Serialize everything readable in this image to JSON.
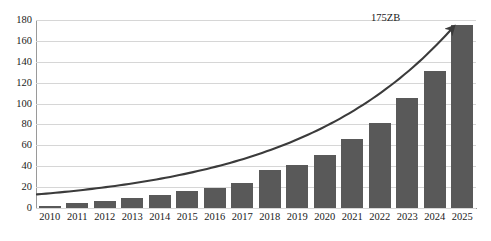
{
  "chart_data": {
    "type": "bar",
    "title": "",
    "subtitle": "",
    "xlabel": "",
    "ylabel": "",
    "categories": [
      "2010",
      "2011",
      "2012",
      "2013",
      "2014",
      "2015",
      "2016",
      "2017",
      "2018",
      "2019",
      "2020",
      "2021",
      "2022",
      "2023",
      "2024",
      "2025"
    ],
    "values": [
      2,
      5,
      7,
      10,
      12,
      16,
      19,
      24,
      36,
      41,
      51,
      66,
      81,
      105,
      131,
      175
    ],
    "series": [
      {
        "name": "Global data volume",
        "values": [
          2,
          5,
          7,
          10,
          12,
          16,
          19,
          24,
          36,
          41,
          51,
          66,
          81,
          105,
          131,
          175
        ]
      }
    ],
    "ylim": [
      0,
      180
    ],
    "ytick_labels": [
      "0",
      "20",
      "40",
      "60",
      "80",
      "100",
      "120",
      "140",
      "160",
      "180"
    ],
    "ytick_values": [
      0,
      20,
      40,
      60,
      80,
      100,
      120,
      140,
      160,
      180
    ],
    "grid": true,
    "legend": false,
    "legend_position": "none",
    "annotations": [
      {
        "text": "175ZB",
        "kind": "arrow-label",
        "x_category": "2025",
        "y_value": 175
      }
    ],
    "overlay_curve": {
      "kind": "trend-arrow",
      "start_value": 13,
      "end_value": 170,
      "arrowhead": true
    },
    "colors": {
      "bar": "#595959",
      "curve": "#3b3b3b",
      "grid": "#d6d6d6",
      "axis": "#9a9a9a",
      "text": "#1a1a1a",
      "background": "#ffffff"
    }
  }
}
